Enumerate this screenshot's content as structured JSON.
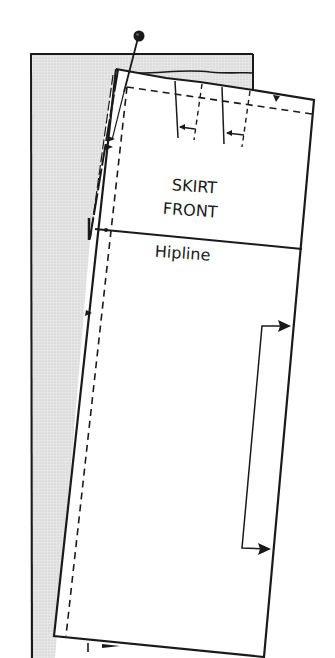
{
  "diagram": {
    "piece_label_line1": "SKIRT",
    "piece_label_line2": "FRONT",
    "hipline_label": "Hipline",
    "colors": {
      "line": "#1a1a1a",
      "underlay_fill": "#e2e2e2",
      "piece_fill": "#ffffff",
      "background": "#ffffff"
    }
  }
}
